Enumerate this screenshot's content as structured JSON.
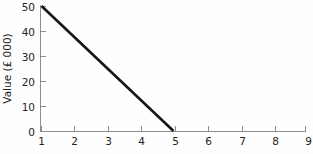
{
  "chart_data": {
    "type": "line",
    "title": "",
    "xlabel": "",
    "ylabel": "Value (£ 000)",
    "xlim": [
      1,
      9
    ],
    "ylim": [
      0,
      50
    ],
    "grid": false,
    "legend": null,
    "x_ticks": [
      "1",
      "2",
      "3",
      "4",
      "5",
      "6",
      "7",
      "8",
      "9"
    ],
    "y_ticks": [
      "0",
      "10",
      "20",
      "30",
      "40",
      "50"
    ],
    "x_tick_values": [
      1,
      2,
      3,
      4,
      5,
      6,
      7,
      8,
      9
    ],
    "y_tick_values": [
      0,
      10,
      20,
      30,
      40,
      50
    ],
    "series": [
      {
        "name": "Value",
        "x": [
          1,
          5
        ],
        "values": [
          50,
          0
        ]
      }
    ],
    "colors": {
      "line": "#151515",
      "axis": "#8d8d8d",
      "text": "#232323",
      "background": "#fefefe"
    }
  },
  "footer": {
    "clipped_text": ""
  }
}
